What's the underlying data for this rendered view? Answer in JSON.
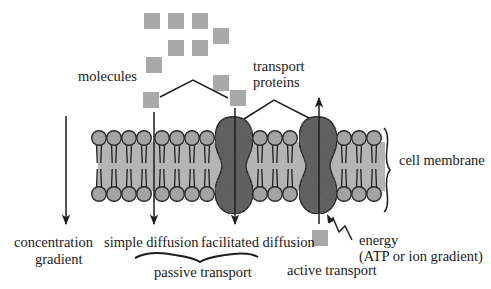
{
  "labels": {
    "molecules": "molecules",
    "transport_proteins_1": "transport",
    "transport_proteins_2": "proteins",
    "cell_membrane": "cell membrane",
    "concentration_gradient_1": "concentration",
    "concentration_gradient_2": "gradient",
    "simple_diffusion": "simple diffusion",
    "facilitated_diffusion": "facilitated diffusion",
    "passive_transport": "passive transport",
    "active_transport": "active transport",
    "energy_1": "energy",
    "energy_2": "(ATP or ion gradient)"
  },
  "colors": {
    "molecule": "#a9a9a9",
    "lipid_head": "#a3a3a3",
    "lipid_fill": "#b4b4b4",
    "protein": "#5f5f5f",
    "line": "#1e1e1e"
  },
  "molecules": [
    {
      "x": 144,
      "y": 13
    },
    {
      "x": 168,
      "y": 13
    },
    {
      "x": 192,
      "y": 13
    },
    {
      "x": 213,
      "y": 28
    },
    {
      "x": 168,
      "y": 40
    },
    {
      "x": 192,
      "y": 40
    },
    {
      "x": 146,
      "y": 57
    },
    {
      "x": 213,
      "y": 75
    },
    {
      "x": 143,
      "y": 92
    },
    {
      "x": 230,
      "y": 90
    },
    {
      "x": 312,
      "y": 230
    }
  ],
  "lipid_heads_x": [
    99,
    114,
    129,
    144,
    162,
    177,
    192,
    207,
    260,
    275,
    290,
    344,
    359,
    374
  ],
  "proteins": [
    {
      "name": "facilitated-diffusion-protein",
      "cx": 234
    },
    {
      "name": "active-transport-protein",
      "cx": 318
    }
  ]
}
